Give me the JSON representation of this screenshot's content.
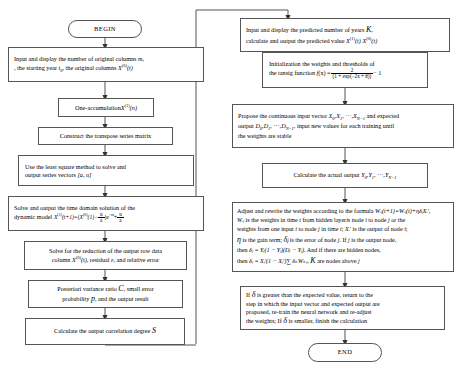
{
  "diagram": {
    "line_color": "#555555",
    "background": "#ffffff"
  },
  "left_column": {
    "begin": {
      "label": "BEGIN"
    },
    "n1_line1": "Input and display the number of original columns",
    "n1_var1": "m",
    "n1_line2a": ", the starting year",
    "n1_var2": "t",
    "n1_var2sub": "0",
    "n1_line2b": ", the original columns",
    "n1_var3": "X",
    "n1_var3sup": "(0)",
    "n1_var3arg": "(t)",
    "n2_text": "One-accumulation",
    "n2_var": "X",
    "n2_sup": "(1)",
    "n2_arg": "(n)",
    "n3_text": "Construct the transpose series matrix",
    "n4_line1": "Use the least square method to solve and",
    "n4_line2": "output series vectors",
    "n4_vec": "[a, u]",
    "n5_line1": "Solve and output the time domain solution of the",
    "n5_line2": "dynamic model",
    "n5_eq_lhs": "X",
    "n5_eq_lhs_sup": "(1)",
    "n5_eq_lhs_arg": "(t+1)=",
    "n5_eq_b1": "X",
    "n5_eq_b1_sup": "(0)",
    "n5_eq_b1_arg": "(1)−",
    "n5_frac1_num": "u",
    "n5_frac1_den": "a",
    "n5_eq_mid": "e",
    "n5_eq_exp": "−at",
    "n5_eq_plus": "+",
    "n5_frac2_num": "u",
    "n5_frac2_den": "a",
    "n6_line1": "Solve for the reduction of the output row data",
    "n6_line2a": "column",
    "n6_var": "X",
    "n6_var_sup": "(0)",
    "n6_var_arg": "(t)",
    "n6_line2b": ", residual",
    "n6_eps": "ε",
    "n6_line2c": ", and relative error",
    "n7_line1a": "Posteriori variance ratio",
    "n7_c": "C",
    "n7_line1b": ", small error",
    "n7_line2a": "probability",
    "n7_p": "p",
    "n7_line2b": ", and the output result",
    "n8_text": "Calculate the output correlation degree",
    "n8_var": "S"
  },
  "right_column": {
    "r1_line1a": "Input and display the predicted number of years",
    "r1_k": "K",
    "r1_line1b": ",",
    "r1_line2": "calculate and output the predicted value",
    "r1_v1": "X",
    "r1_v1_sup": "(1)",
    "r1_v1_arg": "(t)",
    "r1_v2": "X",
    "r1_v2_sup": "(0)",
    "r1_v2_arg": "(t)",
    "r2_line1": "Initialization the weights and thresholds of",
    "r2_line2a": "the tansig function",
    "r2_f": "f",
    "r2_f_arg": "(x) =",
    "r2_num": "2",
    "r2_den": "(1 + exp(−2x + θ))",
    "r2_tail": "− 1",
    "r3_line1a": "Propose the continuous input vector",
    "r3_x0": "X",
    "r3_x0_sub": "0",
    "r3_x1": "X",
    "r3_x1_sub": "1",
    "r3_xdots": ", ···,",
    "r3_xn": "X",
    "r3_xn_sub": "N−1",
    "r3_line1b": "and expected",
    "r3_line2a": "output",
    "r3_d0": "D",
    "r3_d0_sub": "0",
    "r3_d1": "D",
    "r3_d1_sub": "1",
    "r3_ddots": ", ···,",
    "r3_dn": "D",
    "r3_dn_sub": "N−1",
    "r3_line2b": ", input new values for each training until",
    "r3_line3": "the weights are stable",
    "r4_text": "Calculate the actual output",
    "r4_y0": "Y",
    "r4_y0_sub": "0",
    "r4_y1": "Y",
    "r4_y1_sub": "1",
    "r4_ydots": ", ···,",
    "r4_yn": "Y",
    "r4_yn_sub": "N−1",
    "r5_l1a": "Adjust and rewrite the weights according to the formula",
    "r5_l1_eq": "Wᵢⱼ(t+1)=Wᵢⱼ(t)+ηδⱼXᵢ′",
    "r5_l1b": ",",
    "r5_l2a": "Wᵢⱼ",
    "r5_l2b": "is the weights in time",
    "r5_l2_t": "t",
    "r5_l2c": "from hidden layer",
    "r5_l2_i": "i",
    "r5_l2d": "s node",
    "r5_l2_i2": "i",
    "r5_l2e": "to node",
    "r5_l2_j": "j",
    "r5_l2f": "or the",
    "r5_l3a": "weights from one input",
    "r5_l3_i": "i",
    "r5_l3b": "to node",
    "r5_l3_j": "j",
    "r5_l3c": "in time",
    "r5_l3_t": "t",
    "r5_l3d": ";",
    "r5_l3_x": "Xᵢ′",
    "r5_l3e": "is the output of node",
    "r5_l3_i2": "i",
    "r5_l3f": ";",
    "r5_l4a": "η",
    "r5_l4b": "is the gain term;",
    "r5_l4_d": "δⱼ",
    "r5_l4c": "is the error of node",
    "r5_l4_j": "j",
    "r5_l4d": ". If",
    "r5_l4_j2": "j",
    "r5_l4e": "is the output node,",
    "r5_l5a": "then",
    "r5_l5_eq": "δⱼ = Yⱼ(1 − Yⱼ)(Dⱼ − Yⱼ)",
    "r5_l5b": ". And if there are hidden nodes,",
    "r5_l6a": "then",
    "r5_l6_eq": "δⱼ = Xⱼ′(1 − Xⱼ′)∑ δₖWₖⱼ",
    "r5_l6b": ",",
    "r5_l6_k": "K",
    "r5_l6c": "are nodes above",
    "r5_l6_j": "j",
    "r6_l1a": "If",
    "r6_delta": "δ",
    "r6_l1b": "is greater than the expected value, return to the",
    "r6_l2": "step in which the input vector and expected output are",
    "r6_l3": "proposed, re-train the neural network and re-adjust",
    "r6_l4a": "the weights; If",
    "r6_delta2": "δ",
    "r6_l4b": "is smaller, finish the calculation",
    "end": {
      "label": "END"
    }
  }
}
